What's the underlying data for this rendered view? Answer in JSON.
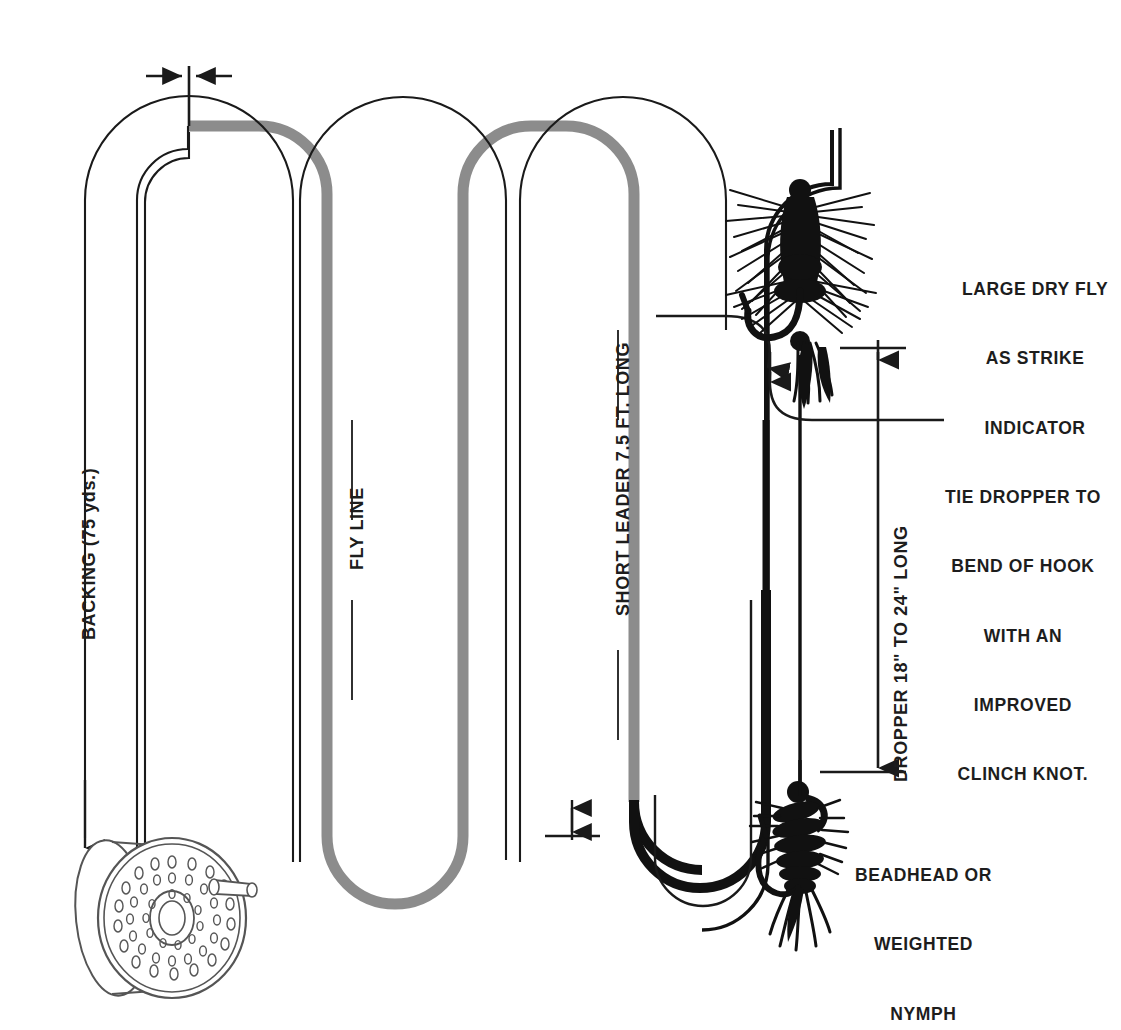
{
  "diagram": {
    "background_color": "#ffffff",
    "ink_color": "#1a1a1a",
    "flyline_color": "#8c8c8c",
    "leader_color": "#111111"
  },
  "labels": {
    "backing": "BACKING (75 yds.)",
    "fly_line": "FLY LINE",
    "short_leader": "SHORT LEADER 7.5 FT. LONG",
    "dropper": "DROPPER 18\" TO 24\" LONG",
    "dry_fly_line1": "LARGE DRY FLY",
    "dry_fly_line2": "AS STRIKE",
    "dry_fly_line3": "INDICATOR",
    "tie_line1": "TIE DROPPER TO",
    "tie_line2": "BEND OF HOOK",
    "tie_line3": "WITH AN",
    "tie_line4": "IMPROVED",
    "tie_line5": "CLINCH KNOT.",
    "nymph_line1": "BEADHEAD OR",
    "nymph_line2": "WEIGHTED",
    "nymph_line3": "NYMPH"
  },
  "components": {
    "reel": "fly-reel-with-perforated-spool-and-handle",
    "dry_fly": "large-bushy-dry-fly-hackled",
    "nymph": "beadhead-weighted-nymph",
    "backing_length": "75 yds.",
    "leader_length": "7.5 FT.",
    "dropper_length_min": "18\"",
    "dropper_length_max": "24\"",
    "knot_type": "IMPROVED CLINCH KNOT"
  },
  "markers": {
    "backing_to_flyline": "double-arrow-junction-marker",
    "flyline_to_leader": "double-arrow-junction-marker",
    "dry_fly_dimension_top": "double-arrow-dimension-tick",
    "dropper_dimension": "dimension-arrow-down",
    "dropper_pointer": "curved-arrow-to-hook-bend"
  }
}
